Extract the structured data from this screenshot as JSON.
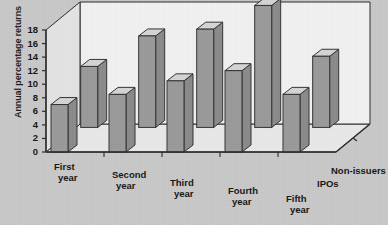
{
  "chart_data": {
    "type": "bar",
    "title": "",
    "subtitle": "",
    "xlabel": "",
    "ylabel": "Annual percentage returns",
    "zlabel": "",
    "ylim": [
      0,
      18
    ],
    "yticks": [
      0,
      2,
      4,
      6,
      8,
      10,
      12,
      14,
      16,
      18
    ],
    "ytick_labels": [
      "0",
      "2",
      "4",
      "6",
      "8",
      "10",
      "12",
      "14",
      "16",
      "18"
    ],
    "grid": false,
    "projection": "3d",
    "legend_position": "depth-axis-right",
    "categories": [
      "First year",
      "Second year",
      "Third year",
      "Fourth year",
      "Fifth year"
    ],
    "category_lines": [
      [
        "First",
        "year"
      ],
      [
        "Second",
        "year"
      ],
      [
        "Third",
        "year"
      ],
      [
        "Fourth",
        "year"
      ],
      [
        "Fifth",
        "year"
      ]
    ],
    "series": [
      {
        "name": "IPOs",
        "values": [
          7,
          8.5,
          10.5,
          12,
          8.5
        ]
      },
      {
        "name": "Non-issuers",
        "values": [
          9,
          13.5,
          14.5,
          18,
          10.5
        ]
      }
    ],
    "colors": {
      "bar_front": "#9a9a9a",
      "bar_side": "#8a8a8a",
      "bar_top": "#d5d5d5",
      "bar_edge": "#333333",
      "plot_floor": "#e9e9e9",
      "plot_back_wall": "#f2f2f2",
      "plot_side_wall": "#e4e4e4",
      "page_background": "#c9c9c9",
      "axis_line": "#2a2a2a",
      "text": "#151515"
    }
  },
  "axis": {
    "y_title": "Annual percentage returns"
  },
  "legend": {
    "front_series_label": "IPOs",
    "back_series_label": "Non-issuers"
  }
}
